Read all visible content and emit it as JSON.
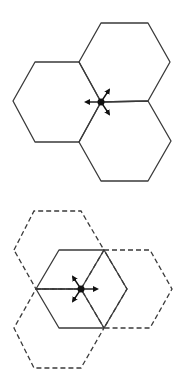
{
  "figure": {
    "panels": [
      {
        "id": "top",
        "description": "Three solid hexagons meeting at a common vertex with a dot and three outward arrows",
        "hexagons": [
          {
            "style": "solid",
            "points": "13,101 35,62 79,62 101,102 79,142 35,142"
          },
          {
            "style": "solid",
            "points": "79,62 101,23 148,23 170,62 148,101 101,102"
          },
          {
            "style": "solid",
            "points": "101,102 148,101 171,141 148,181 101,181 79,142"
          }
        ],
        "dot": {
          "x": 101,
          "y": 102
        },
        "arrows": [
          {
            "dir": "left",
            "x2": 86,
            "y2": 102
          },
          {
            "dir": "up-right",
            "x2": 109,
            "y2": 90
          },
          {
            "dir": "down-right",
            "x2": 109,
            "y2": 114
          }
        ]
      },
      {
        "id": "bottom",
        "description": "One solid hexagon subdivided into three rhombi, overlapped by three dashed hexagons, with dot and three arrows",
        "hexagons": [
          {
            "style": "dashed",
            "points": "14,250 34,211 81,211 104,250 81,289 36,289"
          },
          {
            "style": "dashed",
            "points": "104,250 150,250 172,289 150,328 104,328 127,289"
          },
          {
            "style": "dashed",
            "points": "36,289 81,289 104,328 81,368 34,368 14,328"
          },
          {
            "style": "solid",
            "points": "36,289 59,250 104,250 127,289 104,328 59,328"
          }
        ],
        "inner_lines": [
          {
            "x1": 36,
            "y1": 289,
            "x2": 81,
            "y2": 289
          },
          {
            "x1": 81,
            "y1": 289,
            "x2": 104,
            "y2": 250
          },
          {
            "x1": 81,
            "y1": 289,
            "x2": 104,
            "y2": 328
          }
        ],
        "dot": {
          "x": 81,
          "y": 289
        },
        "arrows": [
          {
            "dir": "right",
            "x2": 97,
            "y2": 289
          },
          {
            "dir": "up-left",
            "x2": 73,
            "y2": 277
          },
          {
            "dir": "down-left",
            "x2": 73,
            "y2": 301
          }
        ]
      }
    ],
    "colors": {
      "line": "#3a3a3a",
      "dot": "#111111",
      "background": "#ffffff"
    }
  }
}
